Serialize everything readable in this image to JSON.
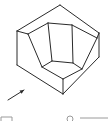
{
  "diagram": {
    "type": "isometric-drawing",
    "line_color": "#2a2a2a",
    "background": "#ffffff",
    "outer_outline": [
      [
        60,
        5
      ],
      [
        99,
        33
      ],
      [
        99,
        57
      ],
      [
        63,
        94
      ],
      [
        17,
        65
      ],
      [
        17,
        31
      ]
    ],
    "edges": [
      [
        [
          17,
          31
        ],
        [
          60,
          5
        ]
      ],
      [
        [
          60,
          5
        ],
        [
          99,
          33
        ]
      ],
      [
        [
          99,
          33
        ],
        [
          99,
          57
        ]
      ],
      [
        [
          99,
          57
        ],
        [
          63,
          94
        ]
      ],
      [
        [
          63,
          94
        ],
        [
          17,
          65
        ]
      ],
      [
        [
          17,
          65
        ],
        [
          17,
          31
        ]
      ],
      [
        [
          17,
          31
        ],
        [
          28,
          34
        ]
      ],
      [
        [
          28,
          34
        ],
        [
          48,
          23
        ]
      ],
      [
        [
          48,
          23
        ],
        [
          72,
          25
        ]
      ],
      [
        [
          72,
          25
        ],
        [
          97,
          38
        ]
      ],
      [
        [
          97,
          38
        ],
        [
          99,
          33
        ]
      ],
      [
        [
          48,
          23
        ],
        [
          52,
          61
        ]
      ],
      [
        [
          72,
          25
        ],
        [
          73,
          63
        ]
      ],
      [
        [
          52,
          61
        ],
        [
          73,
          63
        ]
      ],
      [
        [
          28,
          34
        ],
        [
          42,
          67
        ]
      ],
      [
        [
          97,
          38
        ],
        [
          82,
          69
        ]
      ],
      [
        [
          52,
          61
        ],
        [
          42,
          67
        ]
      ],
      [
        [
          73,
          63
        ],
        [
          82,
          69
        ]
      ],
      [
        [
          42,
          67
        ],
        [
          63,
          79
        ]
      ],
      [
        [
          82,
          69
        ],
        [
          63,
          79
        ]
      ],
      [
        [
          63,
          79
        ],
        [
          63,
          94
        ]
      ]
    ],
    "view_arrow": {
      "from": [
        8,
        100
      ],
      "to": [
        24,
        90
      ],
      "icon": "view-direction-arrow-icon"
    },
    "bottom_partial": {
      "box": {
        "x": 1,
        "y": 117,
        "w": 11
      },
      "circle": {
        "cx": 70,
        "cy": 119,
        "r": 3
      },
      "line": {
        "x1": 80,
        "x2": 108,
        "y": 118
      }
    }
  }
}
